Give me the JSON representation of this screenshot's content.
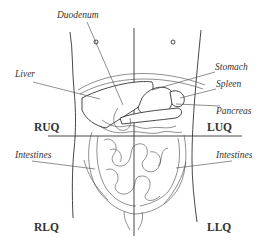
{
  "diagram": {
    "organ_labels": {
      "duodenum": "Duodenum",
      "liver": "Liver",
      "stomach": "Stomach",
      "spleen": "Spleen",
      "pancreas": "Pancreas",
      "intestines_left": "Intestines",
      "intestines_right": "Intestines"
    },
    "quadrant_labels": {
      "ruq": "RUQ",
      "luq": "LUQ",
      "rlq": "RLQ",
      "llq": "LLQ"
    },
    "colors": {
      "stroke": "#333333",
      "background": "#ffffff"
    }
  }
}
